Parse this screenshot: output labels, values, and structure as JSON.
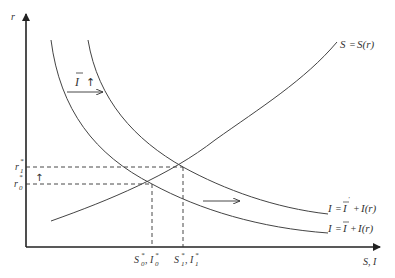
{
  "diagram": {
    "type": "economics-supply-investment",
    "axes": {
      "y_label": "r",
      "x_label": "S, I"
    },
    "curves": {
      "saving": {
        "label_lhs": "S",
        "label_eq": "=",
        "label_rhs": "S(r)"
      },
      "investment_initial": {
        "label": "I = Ī + I(r)",
        "i": "I",
        "eq": "=",
        "ibar": "I",
        "plus": "+",
        "ir": "I(r)"
      },
      "investment_shifted": {
        "label": "I = Ī' + I(r)",
        "i": "I",
        "eq": "=",
        "ibar": "I",
        "prime": "'",
        "plus": "+",
        "ir": "I(r)"
      }
    },
    "annotations": {
      "shift_label_var": "I",
      "shift_label_arrow": "↑",
      "rate_up_arrow": "↑"
    },
    "y_ticks": [
      {
        "base": "r",
        "sub": "1",
        "sup": "*"
      },
      {
        "base": "r",
        "sub": "0",
        "sup": "*"
      }
    ],
    "x_ticks": [
      {
        "s": "S",
        "s_sub": "0",
        "s_sup": "*",
        "sep": ",",
        "i": "I",
        "i_sub": "0",
        "i_sup": "*"
      },
      {
        "s": "S",
        "s_sub": "1",
        "s_sup": "*",
        "sep": ",",
        "i": "I",
        "i_sub": "1",
        "i_sup": "*"
      }
    ],
    "equilibria": [
      {
        "name": "initial",
        "x_px": 152,
        "y_px": 184
      },
      {
        "name": "shifted",
        "x_px": 183,
        "y_px": 167
      }
    ]
  }
}
